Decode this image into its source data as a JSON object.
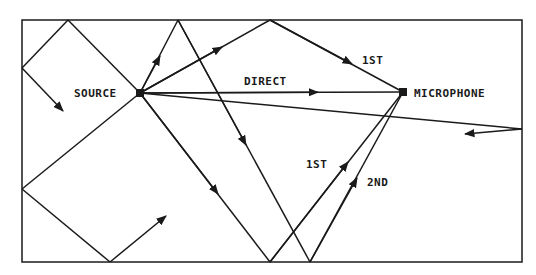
{
  "diagram": {
    "type": "acoustic reflection paths in a room",
    "labels": {
      "source": "SOURCE",
      "microphone": "MICROPHONE",
      "direct": "DIRECT",
      "first_top": "1ST",
      "first_bottom": "1ST",
      "second": "2ND"
    },
    "colors": {
      "line": "#1a1a1a",
      "background": "#ffffff"
    }
  }
}
